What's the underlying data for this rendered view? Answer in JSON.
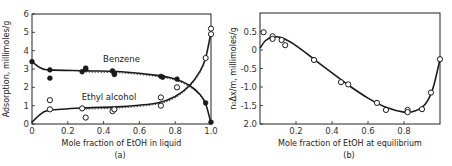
{
  "chart_data": [
    {
      "panel": "(a)",
      "type": "line",
      "title": "",
      "xlabel": "Mole fraction of EtOH in liquid",
      "ylabel": "Adsorption, millimoles/g",
      "xlim": [
        0,
        1.0
      ],
      "ylim": [
        0,
        6
      ],
      "xticks": [
        "0",
        "0.2",
        "0.4",
        "0.6",
        "0.8",
        "1.0"
      ],
      "yticks": [
        "0",
        "1",
        "2",
        "3",
        "4",
        "5",
        "6"
      ],
      "grid": false,
      "caption": "(a)",
      "series": [
        {
          "name": "Benzene",
          "marker": "filled-circle",
          "points": [
            [
              0.0,
              3.4
            ],
            [
              0.1,
              2.95
            ],
            [
              0.1,
              2.5
            ],
            [
              0.28,
              2.85
            ],
            [
              0.3,
              3.0
            ],
            [
              0.3,
              3.05
            ],
            [
              0.45,
              2.9
            ],
            [
              0.46,
              2.75
            ],
            [
              0.46,
              2.7
            ],
            [
              0.72,
              2.6
            ],
            [
              0.73,
              2.55
            ],
            [
              0.81,
              2.45
            ],
            [
              0.97,
              1.15
            ],
            [
              1.0,
              0.1
            ]
          ],
          "curve": [
            [
              0.0,
              3.4
            ],
            [
              0.05,
              3.05
            ],
            [
              0.1,
              2.95
            ],
            [
              0.3,
              2.9
            ],
            [
              0.5,
              2.85
            ],
            [
              0.7,
              2.65
            ],
            [
              0.8,
              2.45
            ],
            [
              0.88,
              2.1
            ],
            [
              0.94,
              1.6
            ],
            [
              0.97,
              1.1
            ],
            [
              1.0,
              0.05
            ]
          ]
        },
        {
          "name": "Ethyl alcohol",
          "marker": "open-circle",
          "points": [
            [
              0.1,
              1.3
            ],
            [
              0.1,
              0.8
            ],
            [
              0.28,
              0.85
            ],
            [
              0.3,
              0.35
            ],
            [
              0.45,
              0.7
            ],
            [
              0.46,
              0.8
            ],
            [
              0.72,
              1.45
            ],
            [
              0.72,
              1.0
            ],
            [
              0.81,
              2.0
            ],
            [
              0.97,
              3.6
            ],
            [
              1.0,
              4.9
            ],
            [
              1.0,
              5.2
            ]
          ],
          "curve": [
            [
              0.0,
              0.1
            ],
            [
              0.05,
              0.55
            ],
            [
              0.1,
              0.75
            ],
            [
              0.3,
              0.88
            ],
            [
              0.5,
              0.95
            ],
            [
              0.7,
              1.15
            ],
            [
              0.8,
              1.5
            ],
            [
              0.88,
              2.1
            ],
            [
              0.94,
              2.9
            ],
            [
              0.97,
              3.6
            ],
            [
              1.0,
              5.0
            ]
          ]
        }
      ],
      "annotations": [
        "Benzene",
        "Ethyl alcohol"
      ]
    },
    {
      "panel": "(b)",
      "type": "scatter",
      "title": "",
      "xlabel": "Mole fraction of EtOH at equilibrium",
      "ylabel": "n₀Δx/m, millimoles/g",
      "xlim": [
        0,
        1.0
      ],
      "ylim": [
        -2.0,
        1.0
      ],
      "xticks": [
        "0.2",
        "0.4",
        "0.6",
        "0.8"
      ],
      "yticks": [
        "0.5",
        "0",
        "-0.5",
        "-1.0",
        "-1.5",
        "2.0"
      ],
      "grid": false,
      "caption": "(b)",
      "series": [
        {
          "name": "Excess adsorption",
          "marker": "open-circle",
          "points": [
            [
              0.02,
              0.48
            ],
            [
              0.07,
              0.37
            ],
            [
              0.07,
              0.3
            ],
            [
              0.12,
              0.27
            ],
            [
              0.14,
              0.13
            ],
            [
              0.3,
              -0.27
            ],
            [
              0.45,
              -0.87
            ],
            [
              0.49,
              -0.93
            ],
            [
              0.65,
              -1.43
            ],
            [
              0.7,
              -1.62
            ],
            [
              0.82,
              -1.62
            ],
            [
              0.82,
              -1.68
            ],
            [
              0.9,
              -1.6
            ],
            [
              0.95,
              -1.15
            ],
            [
              1.0,
              -0.25
            ]
          ],
          "curve": [
            [
              0.0,
              0.05
            ],
            [
              0.03,
              0.25
            ],
            [
              0.07,
              0.35
            ],
            [
              0.12,
              0.33
            ],
            [
              0.2,
              0.12
            ],
            [
              0.3,
              -0.25
            ],
            [
              0.4,
              -0.62
            ],
            [
              0.5,
              -0.98
            ],
            [
              0.6,
              -1.3
            ],
            [
              0.7,
              -1.55
            ],
            [
              0.8,
              -1.68
            ],
            [
              0.86,
              -1.65
            ],
            [
              0.92,
              -1.45
            ],
            [
              0.96,
              -1.05
            ],
            [
              1.0,
              -0.25
            ]
          ]
        }
      ]
    }
  ]
}
